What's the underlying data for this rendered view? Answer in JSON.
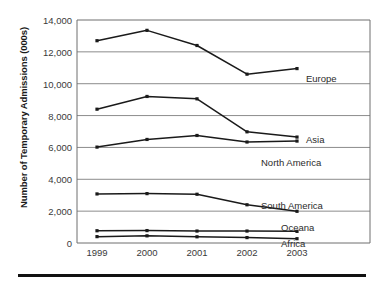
{
  "chart_data": {
    "type": "line",
    "title": "",
    "subtitle": "",
    "xlabel": "",
    "ylabel": "Number of Temporary Admissions (000s)",
    "categories": [
      "1999",
      "2000",
      "2001",
      "2002",
      "2003"
    ],
    "x": [
      1999,
      2000,
      2001,
      2002,
      2003
    ],
    "ylim": [
      0,
      14000
    ],
    "yticks": [
      0,
      2000,
      4000,
      6000,
      8000,
      10000,
      12000,
      14000
    ],
    "ytick_labels": [
      "0",
      "2,000",
      "4,000",
      "6,000",
      "8,000",
      "10,000",
      "12,000",
      "14,000"
    ],
    "grid": true,
    "grid_axis": "y",
    "legend": "inline-right-of-series",
    "marker": "square",
    "series": [
      {
        "name": "Europe",
        "values": [
          12700,
          13350,
          12400,
          10600,
          10950
        ],
        "color": "#1a1a1a"
      },
      {
        "name": "Asia",
        "values": [
          8400,
          9200,
          9050,
          6980,
          6650
        ],
        "color": "#1a1a1a"
      },
      {
        "name": "North America",
        "values": [
          6020,
          6500,
          6750,
          6340,
          6400
        ],
        "color": "#1a1a1a"
      },
      {
        "name": "South America",
        "values": [
          3080,
          3100,
          3060,
          2400,
          1990
        ],
        "color": "#1a1a1a"
      },
      {
        "name": "Oceana",
        "values": [
          770,
          780,
          750,
          750,
          730
        ],
        "color": "#1a1a1a"
      },
      {
        "name": "Africa",
        "values": [
          400,
          450,
          390,
          340,
          270
        ],
        "color": "#1a1a1a"
      }
    ]
  },
  "style": {
    "line_color": "#1a1a1a",
    "grid_color": "#8c8c8c",
    "frame_color": "#6e6e6e",
    "text_color": "#2b2b2b",
    "background": "#ffffff",
    "rule_color": "#111111"
  },
  "labels": {
    "series_label_positions": [
      {
        "name": "Europe",
        "x": 306,
        "y": 73
      },
      {
        "name": "Asia",
        "x": 306,
        "y": 134
      },
      {
        "name": "North America",
        "x": 261,
        "y": 157
      },
      {
        "name": "South America",
        "x": 261,
        "y": 200
      },
      {
        "name": "Oceana",
        "x": 281,
        "y": 222
      },
      {
        "name": "Africa",
        "x": 281,
        "y": 238
      }
    ]
  }
}
